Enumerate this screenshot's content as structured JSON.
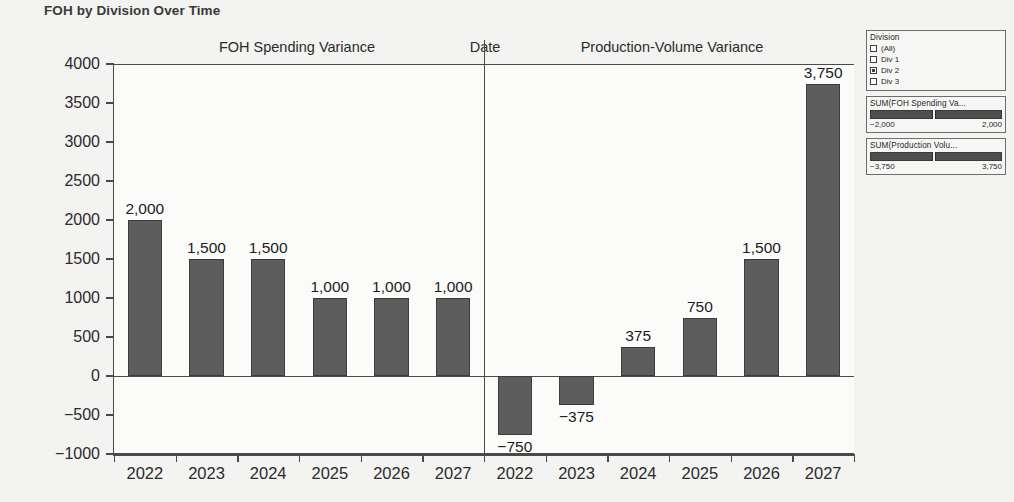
{
  "viz": {
    "title": "FOH by Division Over Time"
  },
  "headers": {
    "left": "FOH Spending Variance",
    "date": "Date",
    "right": "Production-Volume Variance"
  },
  "chart_data": {
    "type": "bar",
    "title": "FOH by Division Over Time",
    "xlabel": "Date",
    "ylabel": "",
    "ylim": [
      -1000,
      4000
    ],
    "ytick_labels": [
      "4000",
      "3500",
      "3000",
      "2500",
      "2000",
      "1500",
      "1000",
      "500",
      "0",
      "−500",
      "−1000"
    ],
    "ytick_values": [
      4000,
      3500,
      3000,
      2500,
      2000,
      1500,
      1000,
      500,
      0,
      -500,
      -1000
    ],
    "grid": false,
    "legend_position": "right",
    "categories": [
      "2022",
      "2023",
      "2024",
      "2025",
      "2026",
      "2027"
    ],
    "panels": [
      {
        "name": "FOH Spending Variance",
        "categories": [
          "2022",
          "2023",
          "2024",
          "2025",
          "2026",
          "2027"
        ],
        "values": [
          2000,
          1500,
          1500,
          1000,
          1000,
          1000
        ],
        "value_labels": [
          "2,000",
          "1,500",
          "1,500",
          "1,000",
          "1,000",
          "1,000"
        ]
      },
      {
        "name": "Production-Volume Variance",
        "categories": [
          "2022",
          "2023",
          "2024",
          "2025",
          "2026",
          "2027"
        ],
        "values": [
          -750,
          -375,
          375,
          750,
          1500,
          3750
        ],
        "value_labels": [
          "−750",
          "−375",
          "375",
          "750",
          "1,500",
          "3,750"
        ]
      }
    ],
    "bar_color": "#5d5d5d"
  },
  "filters": {
    "division": {
      "title": "Division",
      "items": [
        {
          "label": "(All)",
          "checked": false
        },
        {
          "label": "Div 1",
          "checked": false
        },
        {
          "label": "Div 2",
          "checked": true
        },
        {
          "label": "Div 3",
          "checked": false
        }
      ]
    },
    "sliders": [
      {
        "title": "SUM(FOH Spending Va...",
        "min_label": "−2,000",
        "max_label": "2,000",
        "handle_percent": 47
      },
      {
        "title": "SUM(Production Volu...",
        "min_label": "−3,750",
        "max_label": "3,750",
        "handle_percent": 47
      }
    ]
  },
  "colors": {
    "bar": "#5d5d5d",
    "axis": "#4a4a4a",
    "background": "#f3f3f1",
    "plot_background": "#fbfbfa"
  }
}
